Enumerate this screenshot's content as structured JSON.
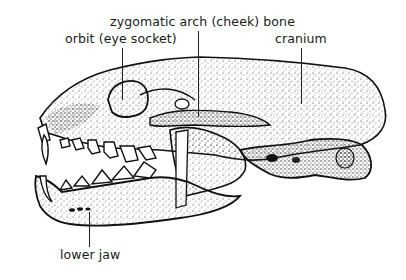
{
  "diagram": {
    "colors": {
      "ink": "#111111",
      "stipple": "#444444",
      "background": "#ffffff"
    },
    "labels": [
      {
        "id": "zygomatic",
        "text": "zygomatic arch (cheek) bone"
      },
      {
        "id": "orbit",
        "text": "orbit (eye socket)"
      },
      {
        "id": "cranium",
        "text": "cranium"
      },
      {
        "id": "lower_jaw",
        "text": "lower jaw"
      }
    ]
  }
}
